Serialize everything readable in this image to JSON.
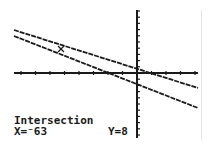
{
  "screen": {
    "mode": "graph",
    "colors": {
      "background": "#ffffff",
      "ink": "#1a1a1a",
      "edge": "#e4e4e4"
    }
  },
  "graph": {
    "axes": {
      "x_axis": {
        "x1": 14,
        "x2": 198,
        "y": 73,
        "tick_spacing": 14.5
      },
      "y_axis": {
        "x": 137,
        "y1": 10,
        "y2": 138,
        "tick_spacing": 6.2
      }
    },
    "lines": [
      {
        "name": "line-1",
        "x1": 14,
        "y1": 30,
        "x2": 198,
        "y2": 88
      },
      {
        "name": "line-2",
        "x1": 14,
        "y1": 36,
        "x2": 198,
        "y2": 108
      }
    ],
    "cursor": {
      "type": "intersection-cursor",
      "x": 61,
      "y": 49
    }
  },
  "status": {
    "title": "Intersection",
    "x_label": "X=",
    "x_value": "⁻63",
    "y_label": "Y=",
    "y_value": "8"
  }
}
